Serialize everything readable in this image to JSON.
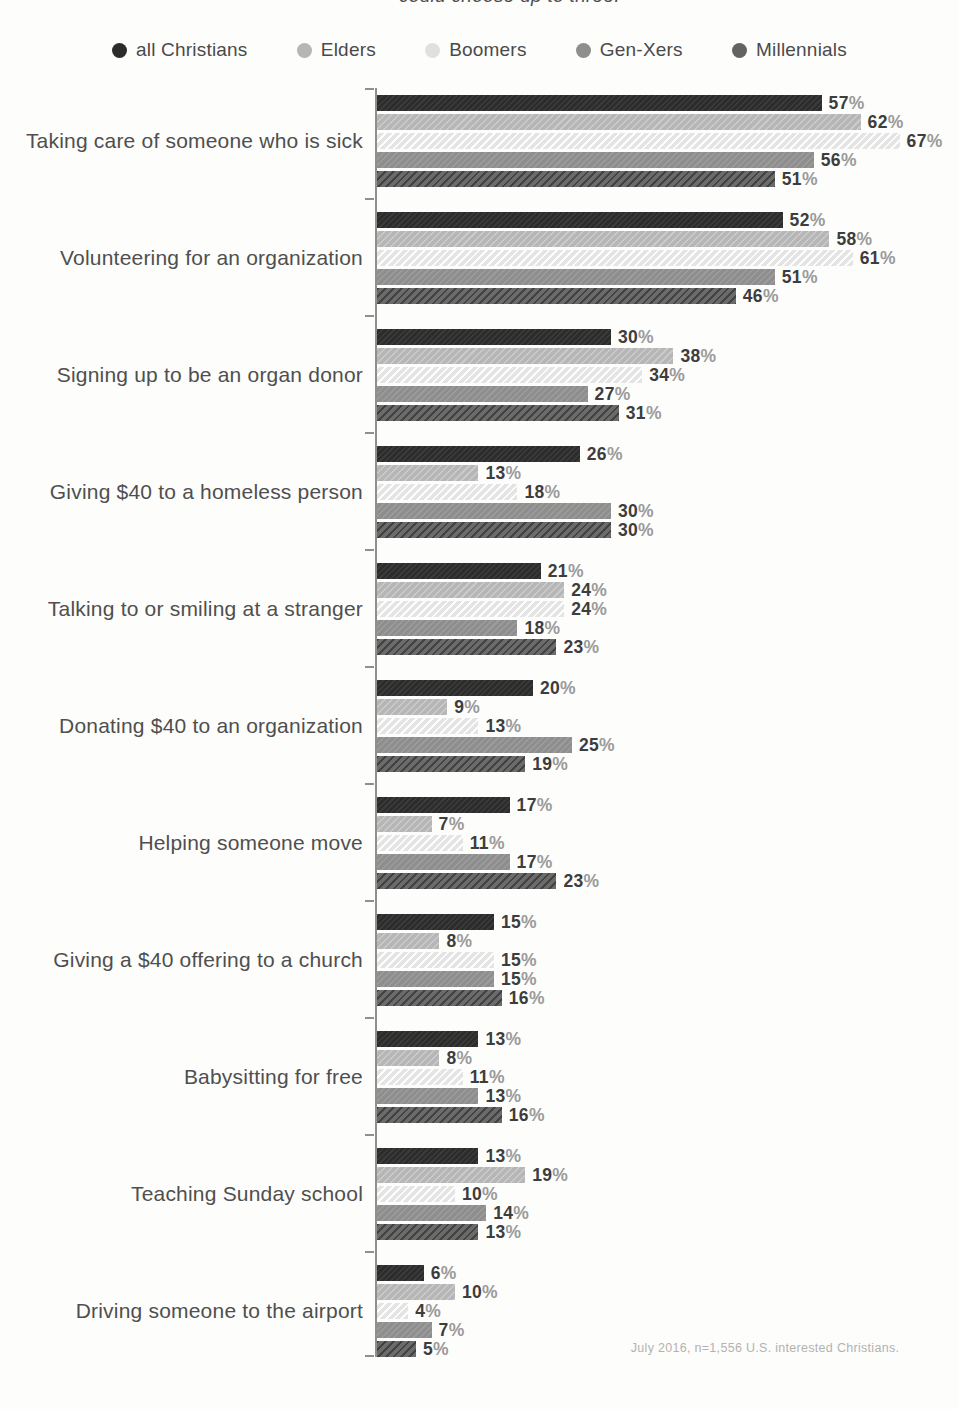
{
  "subtitle_fragment": "could choose up to three.",
  "labels": {
    "percent_suffix": "%"
  },
  "footer": "July 2016, n=1,556 U.S. interested Christians.",
  "legend": [
    {
      "label": "all Christians",
      "color": "#2c2c2c"
    },
    {
      "label": "Elders",
      "color": "#b6b6b6"
    },
    {
      "label": "Boomers",
      "color": "#e0e0e0"
    },
    {
      "label": "Gen-Xers",
      "color": "#8e8e8e"
    },
    {
      "label": "Millennials",
      "color": "#636363"
    }
  ],
  "chart_data": {
    "type": "bar",
    "orientation": "horizontal",
    "title": "",
    "xlabel": "",
    "ylabel": "",
    "xlim": [
      0,
      70
    ],
    "grid": false,
    "legend_position": "top",
    "value_format": "percent",
    "px_per_unit": 7.8,
    "series_names": [
      "all Christians",
      "Elders",
      "Boomers",
      "Gen-Xers",
      "Millennials"
    ],
    "series_colors": [
      "#2c2c2c",
      "#b6b6b6",
      "#e4e4e4",
      "#8e8e8e",
      "#6b6b6b"
    ],
    "categories": [
      "Taking care of someone who is sick",
      "Volunteering for an organization",
      "Signing up to be an organ donor",
      "Giving $40 to a homeless person",
      "Talking to or smiling at a stranger",
      "Donating $40 to an organization",
      "Helping someone move",
      "Giving a $40 offering to a church",
      "Babysitting for free",
      "Teaching Sunday school",
      "Driving someone to the airport"
    ],
    "groups": [
      {
        "category": "Taking care of someone who is sick",
        "values": [
          57,
          62,
          67,
          56,
          51
        ]
      },
      {
        "category": "Volunteering for an organization",
        "values": [
          52,
          58,
          61,
          51,
          46
        ]
      },
      {
        "category": "Signing up to be an organ donor",
        "values": [
          30,
          38,
          34,
          27,
          31
        ]
      },
      {
        "category": "Giving $40 to a homeless person",
        "values": [
          26,
          13,
          18,
          30,
          30
        ]
      },
      {
        "category": "Talking to or smiling at a stranger",
        "values": [
          21,
          24,
          24,
          18,
          23
        ]
      },
      {
        "category": "Donating $40 to an organization",
        "values": [
          20,
          9,
          13,
          25,
          19
        ]
      },
      {
        "category": "Helping someone move",
        "values": [
          17,
          7,
          11,
          17,
          23
        ]
      },
      {
        "category": "Giving a $40 offering to a church",
        "values": [
          15,
          8,
          15,
          15,
          16
        ]
      },
      {
        "category": "Babysitting for free",
        "values": [
          13,
          8,
          11,
          13,
          16
        ]
      },
      {
        "category": "Teaching Sunday school",
        "values": [
          13,
          19,
          10,
          14,
          13
        ]
      },
      {
        "category": "Driving someone to the airport",
        "values": [
          6,
          10,
          4,
          7,
          5
        ]
      }
    ]
  }
}
